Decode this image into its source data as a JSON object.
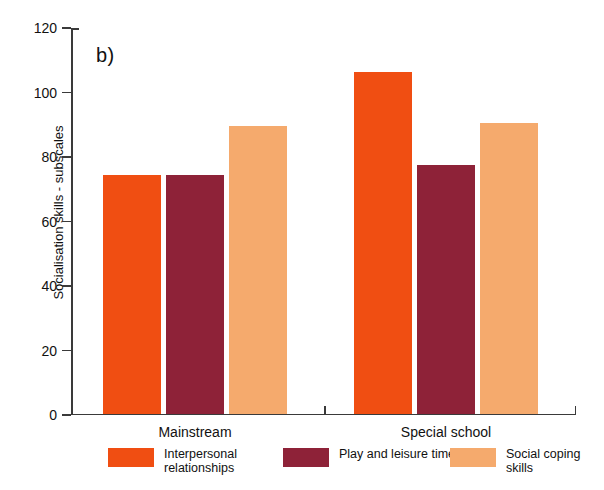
{
  "figure": {
    "panel_label": "b)"
  },
  "chart_data": {
    "type": "bar",
    "title": "",
    "xlabel": "",
    "ylabel": "Socialisation skills - subscales",
    "ylim": [
      0,
      120
    ],
    "yticks": [
      0,
      20,
      40,
      60,
      80,
      100,
      120
    ],
    "grid": false,
    "legend_position": "bottom",
    "categories": [
      "Mainstream",
      "Special school"
    ],
    "series": [
      {
        "name": "Interpersonal relationships",
        "color": "#F04E12",
        "values": [
          74,
          106
        ]
      },
      {
        "name": "Play and leisure time",
        "color": "#8E2238",
        "values": [
          74,
          77
        ]
      },
      {
        "name": "Social coping skills",
        "color": "#F5AA6D",
        "values": [
          89,
          90
        ]
      }
    ]
  },
  "legend": {
    "items": [
      {
        "label": "Interpersonal relationships",
        "color": "#F04E12"
      },
      {
        "label": "Play and leisure time",
        "color": "#8E2238"
      },
      {
        "label": "Social coping skills",
        "color": "#F5AA6D"
      }
    ]
  }
}
